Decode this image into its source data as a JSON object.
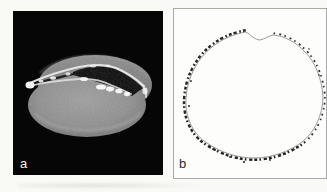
{
  "figure": {
    "page_background": "#f9f9f6",
    "panels": [
      {
        "id": "a",
        "label": "a",
        "kind": "sem-photograph",
        "background": "#060606",
        "label_color": "#f2f2f2"
      },
      {
        "id": "b",
        "label": "b",
        "kind": "stippled-outline-drawing",
        "background": "#fdfdfb",
        "border_color": "#a9a9a9",
        "label_color": "#2a2a2a",
        "ink_color": "#262626",
        "outline_color": "#8f8f8f"
      }
    ]
  }
}
